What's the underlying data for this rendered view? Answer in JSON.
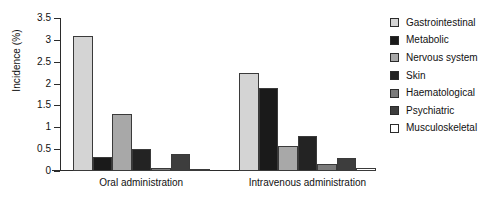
{
  "chart_data": {
    "type": "bar",
    "title": "",
    "xlabel": "",
    "ylabel": "Incidence (%)",
    "ylim": [
      0,
      3.5
    ],
    "ytick_labels": [
      "0",
      "0.5",
      "1",
      "1.5",
      "2",
      "2.5",
      "3",
      "3.5"
    ],
    "ytick_values": [
      0,
      0.5,
      1,
      1.5,
      2,
      2.5,
      3,
      3.5
    ],
    "grid": false,
    "legend_position": "right",
    "categories": [
      "Oral administration",
      "Intravenous administration"
    ],
    "series": [
      {
        "name": "Gastrointestinal",
        "color": "#d4d4d4",
        "values": [
          3.1,
          2.25
        ]
      },
      {
        "name": "Metabolic",
        "color": "#1a1a1a",
        "values": [
          0.33,
          1.9
        ]
      },
      {
        "name": "Nervous system",
        "color": "#a8a8a8",
        "values": [
          1.3,
          0.57
        ]
      },
      {
        "name": "Skin",
        "color": "#232323",
        "values": [
          0.5,
          0.8
        ]
      },
      {
        "name": "Haematological",
        "color": "#7a7a7a",
        "values": [
          0.07,
          0.15
        ]
      },
      {
        "name": "Psychiatric",
        "color": "#3d3d3d",
        "values": [
          0.38,
          0.3
        ]
      },
      {
        "name": "Musculoskeletal",
        "color": "#ffffff",
        "values": [
          0.05,
          0.07
        ]
      }
    ]
  }
}
